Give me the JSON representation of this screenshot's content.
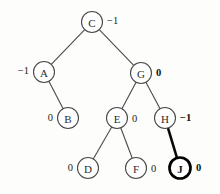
{
  "diagram": {
    "type": "binary-tree",
    "colors": {
      "background": "#fdfdfc",
      "edge": "#4a4a4a",
      "edge_highlight": "#0a0a0a",
      "node_stroke": "#494949",
      "node_stroke_highlight": "#000000",
      "text": "#2b2b2b"
    },
    "nodes": [
      {
        "id": "C",
        "label": "C",
        "x": 92,
        "y": 22,
        "r": 10.5,
        "balance": "−1",
        "balance_bold": false,
        "balance_x": 107,
        "balance_y": 20,
        "balance_anchor": "start",
        "highlighted": false
      },
      {
        "id": "A",
        "label": "A",
        "x": 44,
        "y": 72,
        "r": 10.5,
        "balance": "−1",
        "balance_bold": false,
        "balance_x": 29,
        "balance_y": 70,
        "balance_anchor": "end",
        "highlighted": false
      },
      {
        "id": "G",
        "label": "G",
        "x": 141,
        "y": 73,
        "r": 10.5,
        "balance": "0",
        "balance_bold": true,
        "balance_x": 156,
        "balance_y": 72,
        "balance_anchor": "start",
        "highlighted": false
      },
      {
        "id": "B",
        "label": "B",
        "x": 68,
        "y": 118,
        "r": 10.5,
        "balance": "0",
        "balance_bold": false,
        "balance_x": 53,
        "balance_y": 117,
        "balance_anchor": "end",
        "highlighted": false
      },
      {
        "id": "E",
        "label": "E",
        "x": 117,
        "y": 118,
        "r": 10.5,
        "balance": "0",
        "balance_bold": false,
        "balance_x": 132,
        "balance_y": 118,
        "balance_anchor": "start",
        "highlighted": false
      },
      {
        "id": "H",
        "label": "H",
        "x": 165,
        "y": 118,
        "r": 10.5,
        "balance": "−1",
        "balance_bold": true,
        "balance_x": 180,
        "balance_y": 117,
        "balance_anchor": "start",
        "highlighted": false
      },
      {
        "id": "D",
        "label": "D",
        "x": 88,
        "y": 168,
        "r": 10.5,
        "balance": "0",
        "balance_bold": false,
        "balance_x": 73,
        "balance_y": 167,
        "balance_anchor": "end",
        "highlighted": false
      },
      {
        "id": "F",
        "label": "F",
        "x": 136,
        "y": 168,
        "r": 10.5,
        "balance": "0",
        "balance_bold": false,
        "balance_x": 151,
        "balance_y": 168,
        "balance_anchor": "start",
        "highlighted": false
      },
      {
        "id": "J",
        "label": "J",
        "x": 180,
        "y": 168,
        "r": 10.5,
        "balance": "0",
        "balance_bold": true,
        "balance_x": 196,
        "balance_y": 167,
        "balance_anchor": "start",
        "highlighted": true
      }
    ],
    "edges": [
      {
        "from": "C",
        "to": "A",
        "highlighted": false
      },
      {
        "from": "C",
        "to": "G",
        "highlighted": false
      },
      {
        "from": "A",
        "to": "B",
        "highlighted": false
      },
      {
        "from": "G",
        "to": "E",
        "highlighted": false
      },
      {
        "from": "G",
        "to": "H",
        "highlighted": false
      },
      {
        "from": "E",
        "to": "D",
        "highlighted": false
      },
      {
        "from": "E",
        "to": "F",
        "highlighted": false
      },
      {
        "from": "H",
        "to": "J",
        "highlighted": true
      }
    ]
  }
}
